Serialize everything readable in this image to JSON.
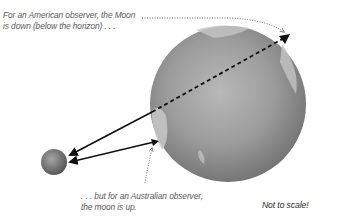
{
  "captions": {
    "american_line1": "For an American observer, the Moon",
    "american_line2": "is down (below the horizon) . . .",
    "australian_line1": ". . . but for an Australian observer,",
    "australian_line2": "the moon is up.",
    "scale_note": "Not to scale!"
  },
  "figure": {
    "earth": {
      "cx": 228,
      "cy": 104,
      "r": 78,
      "color": "#8c8c8c"
    },
    "moon": {
      "cx": 54,
      "cy": 162,
      "r": 13,
      "color": "#7a7a7a"
    },
    "arrow_color": "#111111",
    "dotted_color": "#666666"
  }
}
